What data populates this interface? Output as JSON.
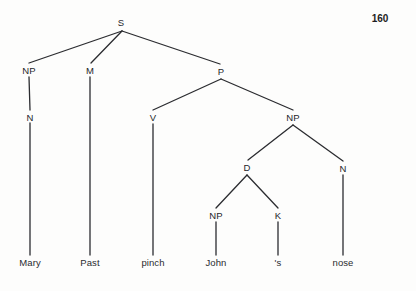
{
  "page": {
    "page_number": "160",
    "background_color": "#fdfdfc",
    "line_color": "#2b2c30",
    "text_color": "#25262a",
    "width": 416,
    "height": 291
  },
  "tree": {
    "sentence": "Mary Past pinch John 's nose",
    "nodes": [
      {
        "id": "S",
        "label": "S",
        "x": 121,
        "y": 22,
        "type": "nonterminal"
      },
      {
        "id": "NP1",
        "label": "NP",
        "x": 29,
        "y": 70,
        "type": "nonterminal"
      },
      {
        "id": "M",
        "label": "M",
        "x": 90,
        "y": 70,
        "type": "nonterminal"
      },
      {
        "id": "P",
        "label": "P",
        "x": 221,
        "y": 71,
        "type": "nonterminal"
      },
      {
        "id": "N1",
        "label": "N",
        "x": 30,
        "y": 117,
        "type": "nonterminal"
      },
      {
        "id": "V",
        "label": "V",
        "x": 153,
        "y": 117,
        "type": "nonterminal"
      },
      {
        "id": "NP2",
        "label": "NP",
        "x": 293,
        "y": 117,
        "type": "nonterminal"
      },
      {
        "id": "D",
        "label": "D",
        "x": 247,
        "y": 167,
        "type": "nonterminal"
      },
      {
        "id": "N2",
        "label": "N",
        "x": 343,
        "y": 168,
        "type": "nonterminal"
      },
      {
        "id": "NP3",
        "label": "NP",
        "x": 216,
        "y": 215,
        "type": "nonterminal"
      },
      {
        "id": "K",
        "label": "K",
        "x": 278,
        "y": 215,
        "type": "nonterminal"
      }
    ],
    "leaves": [
      {
        "id": "L1",
        "label": "Mary",
        "x": 30,
        "y": 262,
        "parent": "N1"
      },
      {
        "id": "L2",
        "label": "Past",
        "x": 90,
        "y": 262,
        "parent": "M"
      },
      {
        "id": "L3",
        "label": "pinch",
        "x": 153,
        "y": 262,
        "parent": "V"
      },
      {
        "id": "L4",
        "label": "John",
        "x": 216,
        "y": 262,
        "parent": "NP3"
      },
      {
        "id": "L5",
        "label": "'s",
        "x": 278,
        "y": 262,
        "parent": "K"
      },
      {
        "id": "L6",
        "label": "nose",
        "x": 343,
        "y": 262,
        "parent": "N2"
      }
    ],
    "edges": [
      {
        "from": "S",
        "to": "NP1",
        "x1": 122,
        "y1": 31,
        "x2": 29,
        "y2": 63
      },
      {
        "from": "S",
        "to": "M",
        "x1": 122,
        "y1": 31,
        "x2": 91,
        "y2": 63
      },
      {
        "from": "S",
        "to": "P",
        "x1": 122,
        "y1": 31,
        "x2": 220,
        "y2": 64
      },
      {
        "from": "NP1",
        "to": "N1",
        "x1": 29,
        "y1": 77,
        "x2": 30,
        "y2": 110
      },
      {
        "from": "N1",
        "to": "L1",
        "x1": 30,
        "y1": 123,
        "x2": 30,
        "y2": 255
      },
      {
        "from": "M",
        "to": "L2",
        "x1": 90,
        "y1": 77,
        "x2": 90,
        "y2": 255
      },
      {
        "from": "P",
        "to": "V",
        "x1": 221,
        "y1": 79,
        "x2": 153,
        "y2": 110
      },
      {
        "from": "P",
        "to": "NP2",
        "x1": 221,
        "y1": 79,
        "x2": 293,
        "y2": 110
      },
      {
        "from": "V",
        "to": "L3",
        "x1": 153,
        "y1": 124,
        "x2": 153,
        "y2": 255
      },
      {
        "from": "NP2",
        "to": "D",
        "x1": 293,
        "y1": 125,
        "x2": 248,
        "y2": 160
      },
      {
        "from": "NP2",
        "to": "N2",
        "x1": 293,
        "y1": 125,
        "x2": 343,
        "y2": 161
      },
      {
        "from": "D",
        "to": "NP3",
        "x1": 247,
        "y1": 175,
        "x2": 216,
        "y2": 208
      },
      {
        "from": "D",
        "to": "K",
        "x1": 247,
        "y1": 175,
        "x2": 278,
        "y2": 208
      },
      {
        "from": "NP3",
        "to": "L4",
        "x1": 216,
        "y1": 222,
        "x2": 216,
        "y2": 255
      },
      {
        "from": "K",
        "to": "L5",
        "x1": 278,
        "y1": 222,
        "x2": 278,
        "y2": 255
      },
      {
        "from": "N2",
        "to": "L6",
        "x1": 343,
        "y1": 175,
        "x2": 343,
        "y2": 255
      }
    ]
  }
}
